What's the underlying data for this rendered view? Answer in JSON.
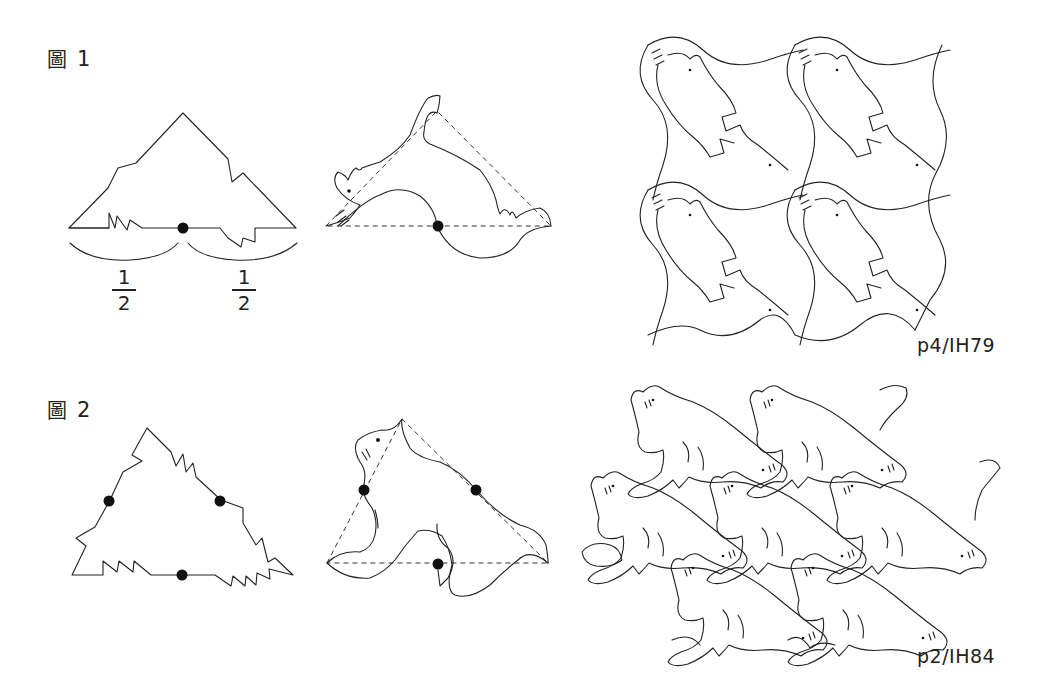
{
  "figures": [
    {
      "id": "figure-1",
      "label_glyph": "圖",
      "label_number": "1",
      "fractions": [
        {
          "numerator": "1",
          "denominator": "2"
        },
        {
          "numerator": "1",
          "denominator": "2"
        }
      ],
      "symmetry_code": "p4/IH79",
      "panels": [
        "tile-outline-with-midpoint",
        "motif-over-dashed-triangle",
        "p4-tessellation"
      ],
      "midpoint_markers": 1
    },
    {
      "id": "figure-2",
      "label_glyph": "圖",
      "label_number": "2",
      "symmetry_code": "p2/IH84",
      "panels": [
        "tile-outline-with-three-midpoints",
        "motif-over-dashed-triangle",
        "p2-tessellation"
      ],
      "midpoint_markers": 3
    }
  ],
  "colors": {
    "background": "#ffffff",
    "line": "#222222",
    "marker": "#111111"
  }
}
